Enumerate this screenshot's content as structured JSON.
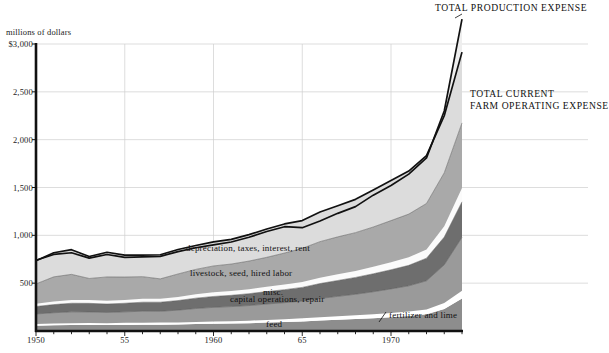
{
  "chart_data": {
    "type": "area",
    "title": "",
    "subtitle": "",
    "xlabel": "",
    "ylabel": "millions of dollars",
    "ylim": [
      0,
      3000
    ],
    "xlim": [
      1950,
      1974
    ],
    "grid": true,
    "stacked": true,
    "legend_position": "inline-annotations",
    "y_ticks": [
      {
        "value": 3000,
        "label": "$3,000"
      },
      {
        "value": 2500,
        "label": "2,500"
      },
      {
        "value": 2000,
        "label": "2,000"
      },
      {
        "value": 1500,
        "label": "1,500"
      },
      {
        "value": 1000,
        "label": "1,000"
      },
      {
        "value": 500,
        "label": "500"
      }
    ],
    "x_ticks": [
      {
        "value": 1950,
        "label": "1950"
      },
      {
        "value": 1955,
        "label": "55"
      },
      {
        "value": 1960,
        "label": "1960"
      },
      {
        "value": 1965,
        "label": "65"
      },
      {
        "value": 1970,
        "label": "1970"
      }
    ],
    "x": [
      1950,
      1951,
      1952,
      1953,
      1954,
      1955,
      1956,
      1957,
      1958,
      1959,
      1960,
      1961,
      1962,
      1963,
      1964,
      1965,
      1966,
      1967,
      1968,
      1969,
      1970,
      1971,
      1972,
      1973,
      1974
    ],
    "series": [
      {
        "name": "fertilizer and lime",
        "label": "fertilizer and lime",
        "color": "#8d8d8d",
        "values": [
          55,
          60,
          62,
          63,
          62,
          64,
          66,
          66,
          68,
          72,
          75,
          78,
          82,
          88,
          94,
          100,
          110,
          118,
          126,
          134,
          145,
          158,
          175,
          230,
          340
        ]
      },
      {
        "name": "gap-1",
        "label": "",
        "color": "#ffffff",
        "values": [
          18,
          19,
          20,
          20,
          20,
          21,
          21,
          22,
          22,
          23,
          24,
          25,
          26,
          28,
          30,
          32,
          34,
          36,
          38,
          40,
          43,
          46,
          50,
          62,
          80
        ]
      },
      {
        "name": "feed",
        "label": "feed",
        "color": "#9a9a9a",
        "values": [
          105,
          112,
          118,
          116,
          112,
          115,
          120,
          118,
          128,
          140,
          148,
          152,
          158,
          166,
          172,
          180,
          196,
          208,
          220,
          236,
          252,
          268,
          300,
          400,
          560
        ]
      },
      {
        "name": "capital operations, repair",
        "label": "capital operations, repair",
        "color": "#6e6e6e",
        "values": [
          78,
          85,
          90,
          90,
          88,
          90,
          94,
          95,
          100,
          108,
          114,
          118,
          124,
          130,
          136,
          144,
          156,
          166,
          176,
          188,
          200,
          214,
          236,
          290,
          370
        ]
      },
      {
        "name": "misc.",
        "label": "misc.",
        "color": "#fbfbfb",
        "values": [
          30,
          32,
          34,
          34,
          33,
          34,
          35,
          36,
          38,
          41,
          43,
          45,
          47,
          50,
          53,
          56,
          60,
          64,
          68,
          73,
          78,
          84,
          92,
          112,
          145
        ]
      },
      {
        "name": "livestock, seed, hired labor",
        "label": "livestock, seed, hired labor",
        "color": "#a9a9a9",
        "values": [
          206,
          258,
          268,
          226,
          250,
          240,
          232,
          208,
          240,
          260,
          276,
          282,
          294,
          308,
          330,
          352,
          378,
          392,
          400,
          416,
          436,
          452,
          480,
          560,
          680
        ]
      },
      {
        "name": "depreciation, taxes, interest, rent",
        "label": "depreciation, taxes, interest, rent",
        "color": "#dcdcdc",
        "values": [
          242,
          252,
          258,
          230,
          258,
          230,
          226,
          252,
          256,
          250,
          252,
          258,
          276,
          296,
          304,
          290,
          310,
          326,
          348,
          388,
          418,
          450,
          500,
          596,
          740
        ]
      }
    ],
    "boundary_lines": [
      {
        "name": "TOTAL CURRENT FARM OPERATING EXPENSE",
        "label": "TOTAL CURRENT\nFARM OPERATING EXPENSE"
      },
      {
        "name": "TOTAL PRODUCTION EXPENSE",
        "label": "TOTAL PRODUCTION EXPENSE"
      }
    ],
    "outer_band": {
      "name": "total production expense band",
      "color": "#efefef",
      "values": [
        0,
        0,
        0,
        0,
        0,
        0,
        0,
        0,
        0,
        0,
        0,
        0,
        0,
        0,
        0,
        0,
        0,
        0,
        0,
        0,
        0,
        0,
        0,
        0,
        0
      ]
    },
    "total_production_expense": [
      740,
      800,
      818,
      762,
      800,
      770,
      775,
      780,
      830,
      870,
      900,
      930,
      980,
      1040,
      1090,
      1080,
      1150,
      1230,
      1300,
      1420,
      1520,
      1640,
      1810,
      2300,
      3260
    ],
    "annotations": {
      "top_line_label": "TOTAL PRODUCTION EXPENSE",
      "second_line_label_line1": "TOTAL CURRENT",
      "second_line_label_line2": "FARM OPERATING EXPENSE"
    }
  },
  "colors": {
    "axis": "#111111",
    "gridline": "#cfcfcf",
    "plot_background": "#ffffff",
    "outer_area": "#eeeeee"
  }
}
